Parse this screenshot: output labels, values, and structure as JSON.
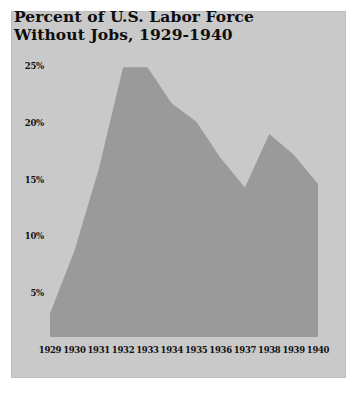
{
  "figure": {
    "background_color": "#ffffff",
    "panel_color": "#c9c9c9",
    "area_color": "#9a9a9a",
    "text_color": "#111111"
  },
  "title": {
    "line1": "Percent of U.S. Labor Force",
    "line2": "Without Jobs, 1929-1940"
  },
  "chart_data": {
    "type": "area",
    "title": "Percent of U.S. Labor Force Without Jobs, 1929-1940",
    "xlabel": "",
    "ylabel": "",
    "grid": false,
    "legend": null,
    "xlim": [
      1929,
      1940
    ],
    "ylim": [
      0,
      26.5
    ],
    "categories": [
      "1929",
      "1930",
      "1931",
      "1932",
      "1933",
      "1934",
      "1935",
      "1936",
      "1937",
      "1938",
      "1939",
      "1940"
    ],
    "x": [
      1929,
      1930,
      1931,
      1932,
      1933,
      1934,
      1935,
      1936,
      1937,
      1938,
      1939,
      1940
    ],
    "values": [
      3.2,
      8.7,
      15.9,
      24.9,
      24.9,
      21.7,
      20.1,
      16.9,
      14.3,
      19.0,
      17.2,
      14.6
    ],
    "ytick_labels": [
      "25%",
      "20%",
      "15%",
      "10%",
      "5%"
    ],
    "ytick_values": [
      25,
      20,
      15,
      10,
      5
    ],
    "xtick_labels": [
      "1929",
      "1930",
      "1931",
      "1932",
      "1933",
      "1934",
      "1935",
      "1936",
      "1937",
      "1938",
      "1939",
      "1940"
    ],
    "series": [
      {
        "name": "Unemployment rate",
        "values": [
          3.2,
          8.7,
          15.9,
          24.9,
          24.9,
          21.7,
          20.1,
          16.9,
          14.3,
          19.0,
          17.2,
          14.6
        ]
      }
    ]
  }
}
